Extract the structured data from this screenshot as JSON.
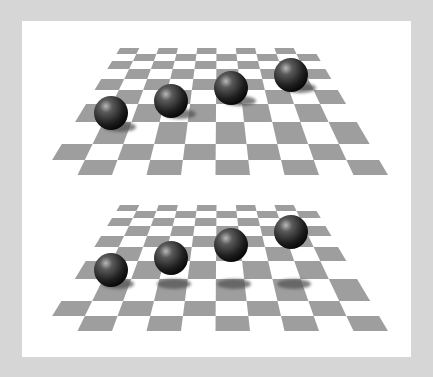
{
  "frame": {
    "background": "#d6d6d6",
    "panel_color": "#ffffff"
  },
  "colors": {
    "tile_dark": "#9e9e9e",
    "tile_light": "#ffffff",
    "sphere_highlight": "#b0b0b0",
    "sphere_mid": "#4a4a4a",
    "sphere_dark": "#0e0e0e",
    "shadow": "#555555"
  },
  "panels": [
    {
      "name": "upper-scene",
      "board": {
        "rows": 10,
        "cols": 10,
        "top_y": 48,
        "bottom_y": 175,
        "top_left_x": 120,
        "top_right_x": 313,
        "bottom_left_x": 43,
        "bottom_right_x": 388,
        "row_ys": [
          48,
          54,
          61,
          69,
          79,
          90,
          104,
          122,
          144,
          160,
          175
        ]
      },
      "spheres": [
        {
          "cx": 111,
          "cy": 113,
          "r": 17
        },
        {
          "cx": 171,
          "cy": 101,
          "r": 17
        },
        {
          "cx": 231,
          "cy": 88,
          "r": 17
        },
        {
          "cx": 291,
          "cy": 75,
          "r": 17
        }
      ],
      "shadows": [
        {
          "cx": 120,
          "cy": 127,
          "rx": 16,
          "ry": 5
        },
        {
          "cx": 180,
          "cy": 114,
          "rx": 16,
          "ry": 5
        },
        {
          "cx": 240,
          "cy": 101,
          "rx": 16,
          "ry": 5
        },
        {
          "cx": 300,
          "cy": 88,
          "rx": 16,
          "ry": 5
        }
      ]
    },
    {
      "name": "lower-scene",
      "board": {
        "rows": 10,
        "cols": 10,
        "top_y": 205,
        "bottom_y": 331,
        "top_left_x": 120,
        "top_right_x": 313,
        "bottom_left_x": 43,
        "bottom_right_x": 388,
        "row_ys": [
          205,
          211,
          218,
          226,
          236,
          247,
          261,
          279,
          301,
          316,
          331
        ]
      },
      "spheres": [
        {
          "cx": 111,
          "cy": 270,
          "r": 17
        },
        {
          "cx": 171,
          "cy": 258,
          "r": 17
        },
        {
          "cx": 231,
          "cy": 245,
          "r": 17
        },
        {
          "cx": 291,
          "cy": 232,
          "r": 17
        }
      ],
      "shadows": [
        {
          "cx": 118,
          "cy": 284,
          "rx": 16,
          "ry": 5
        },
        {
          "cx": 174,
          "cy": 284,
          "rx": 17,
          "ry": 5
        },
        {
          "cx": 234,
          "cy": 284,
          "rx": 17,
          "ry": 5
        },
        {
          "cx": 294,
          "cy": 284,
          "rx": 17,
          "ry": 5
        }
      ]
    }
  ]
}
